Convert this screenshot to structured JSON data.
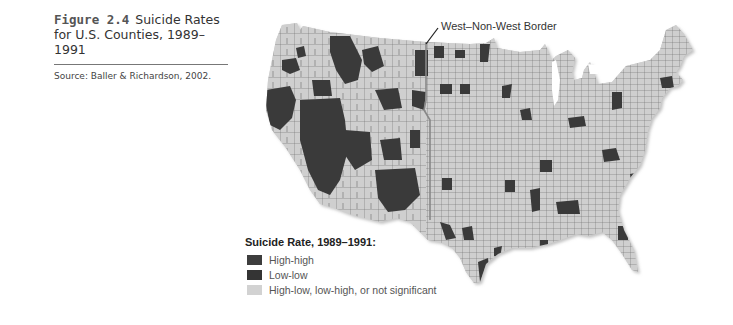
{
  "figure": {
    "number": "Figure 2.4",
    "title": "Suicide Rates for U.S. Counties, 1989–1991",
    "source": "Source: Baller & Richardson, 2002."
  },
  "map": {
    "region": "Contiguous United States, county level",
    "annotation": "West–Non-West Border",
    "colors": {
      "high_high": "#3a3a3a",
      "low_low": "#333333",
      "not_significant": "#cfcfcf",
      "county_border": "#666666"
    }
  },
  "legend": {
    "title": "Suicide Rate, 1989–1991:",
    "items": [
      {
        "label": "High-high",
        "color": "#3d3d3d"
      },
      {
        "label": "Low-low",
        "color": "#343434"
      },
      {
        "label": "High-low, low-high, or not significant",
        "color": "#d2d2d2"
      }
    ]
  }
}
